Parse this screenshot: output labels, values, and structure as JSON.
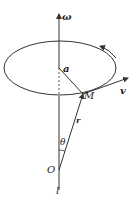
{
  "diagram": {
    "labels": {
      "omega": "ω",
      "a": "a",
      "M": "M",
      "v": "v",
      "r": "r",
      "theta": "θ",
      "O": "O",
      "l": "l"
    },
    "colors": {
      "stroke": "#333333",
      "background": "#ffffff"
    }
  }
}
